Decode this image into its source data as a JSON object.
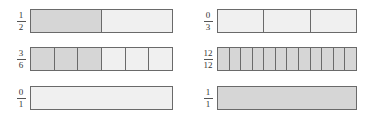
{
  "colors": {
    "shaded": "#d6d6d6",
    "unshaded": "#f0f0f0",
    "border": "#6a6a6a"
  },
  "items": [
    {
      "numerator": "1",
      "denominator": "2",
      "parts": 2,
      "shaded": 1,
      "col": 0,
      "row": 0
    },
    {
      "numerator": "0",
      "denominator": "3",
      "parts": 3,
      "shaded": 0,
      "col": 1,
      "row": 0
    },
    {
      "numerator": "3",
      "denominator": "6",
      "parts": 6,
      "shaded": 3,
      "col": 0,
      "row": 1
    },
    {
      "numerator": "12",
      "denominator": "12",
      "parts": 12,
      "shaded": 12,
      "col": 1,
      "row": 1
    },
    {
      "numerator": "0",
      "denominator": "1",
      "parts": 1,
      "shaded": 0,
      "col": 0,
      "row": 2
    },
    {
      "numerator": "1",
      "denominator": "1",
      "parts": 1,
      "shaded": 1,
      "col": 1,
      "row": 2
    }
  ]
}
